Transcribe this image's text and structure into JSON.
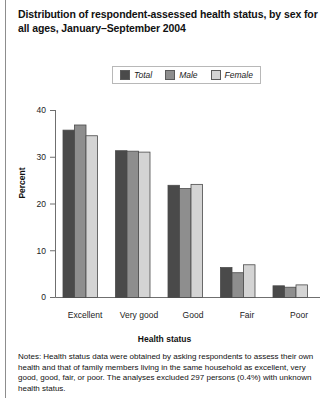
{
  "title": "Distribution of respondent-assessed health status, by sex for all ages, January–September 2004",
  "legend": {
    "entries": [
      {
        "label": "Total",
        "color": "#4a4a4a"
      },
      {
        "label": "Male",
        "color": "#8e8e8e"
      },
      {
        "label": "Female",
        "color": "#d4d4d4"
      }
    ]
  },
  "notes": "Notes: Health status data were obtained by asking respondents to assess their own health and that of family members living in the same household as excellent, very good, good, fair, or poor. The analyses excluded 297 persons (0.4%) with unknown health status.",
  "chart_data": {
    "type": "bar",
    "title": "Distribution of respondent-assessed health status, by sex for all ages, January–September 2004",
    "xlabel": "Health status",
    "ylabel": "Percent",
    "categories": [
      "Excellent",
      "Very good",
      "Good",
      "Fair",
      "Poor"
    ],
    "series": [
      {
        "name": "Total",
        "color": "#4a4a4a",
        "values": [
          35.8,
          31.4,
          24.0,
          6.4,
          2.5
        ]
      },
      {
        "name": "Male",
        "color": "#8e8e8e",
        "values": [
          36.9,
          31.3,
          23.3,
          5.3,
          2.2
        ]
      },
      {
        "name": "Female",
        "color": "#d4d4d4",
        "values": [
          34.6,
          31.1,
          24.2,
          7.0,
          2.7
        ]
      }
    ],
    "ylim": [
      0,
      40
    ],
    "yticks": [
      0,
      10,
      20,
      30,
      40
    ],
    "grid": false,
    "legend_position": "top-center"
  }
}
